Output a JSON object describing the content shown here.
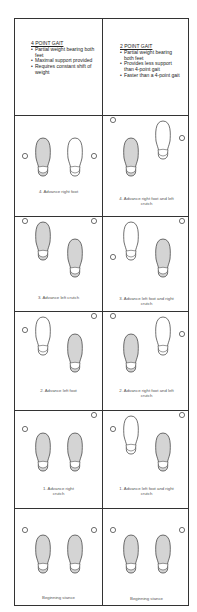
{
  "colors": {
    "line": "#333333",
    "foot_fill_shaded": "#d4d4d4",
    "foot_fill_clear": "#ffffff"
  },
  "columns": [
    {
      "heading": "4 POINT GAIT",
      "bullets": [
        "Partial weight bearing both feet",
        "Maximal support provided",
        "Requires constant shift of weight"
      ],
      "steps": [
        {
          "caption": "4. Advance right foot",
          "left_foot": "back-shaded",
          "right_foot": "back-clear",
          "left_crutch": "back",
          "right_crutch": "back"
        },
        {
          "caption": "3. Advance left crutch",
          "left_foot": "front-shaded",
          "right_foot": "back-shaded",
          "left_crutch": "front",
          "right_crutch": "front"
        },
        {
          "caption": "2. Advance left foot",
          "left_foot": "front-clear",
          "right_foot": "back-shaded",
          "left_crutch": "mid",
          "right_crutch": "front"
        },
        {
          "caption": "1. Advance right crutch",
          "left_foot": "back-shaded",
          "right_foot": "back-shaded",
          "left_crutch": "mid",
          "right_crutch": "front"
        },
        {
          "caption": "Beginning stance",
          "left_foot": "back-shaded",
          "right_foot": "back-shaded",
          "left_crutch": "mid",
          "right_crutch": "mid"
        }
      ]
    },
    {
      "heading": "2 POINT GAIT",
      "bullets": [
        "Partial weight bearing both feet",
        "Provides less support than 4-point gait",
        "Faster than a 4-point gait"
      ],
      "steps": [
        {
          "caption": "4. Advance right foot and left crutch",
          "left_foot": "back-shaded",
          "right_foot": "front-clear",
          "left_crutch": "front",
          "right_crutch": "mid"
        },
        {
          "caption": "3. Advance left foot and right crutch",
          "left_foot": "front-clear",
          "right_foot": "back-shaded",
          "left_crutch": "back",
          "right_crutch": "front"
        },
        {
          "caption": "2. Advance right foot and left crutch",
          "left_foot": "back-shaded",
          "right_foot": "front-clear",
          "left_crutch": "front",
          "right_crutch": "mid"
        },
        {
          "caption": "1. Advance left foot and right crutch",
          "left_foot": "front-clear",
          "right_foot": "back-shaded",
          "left_crutch": "mid",
          "right_crutch": "front"
        },
        {
          "caption": "Beginning stance",
          "left_foot": "back-shaded",
          "right_foot": "back-shaded",
          "left_crutch": "mid",
          "right_crutch": "mid"
        }
      ]
    }
  ]
}
